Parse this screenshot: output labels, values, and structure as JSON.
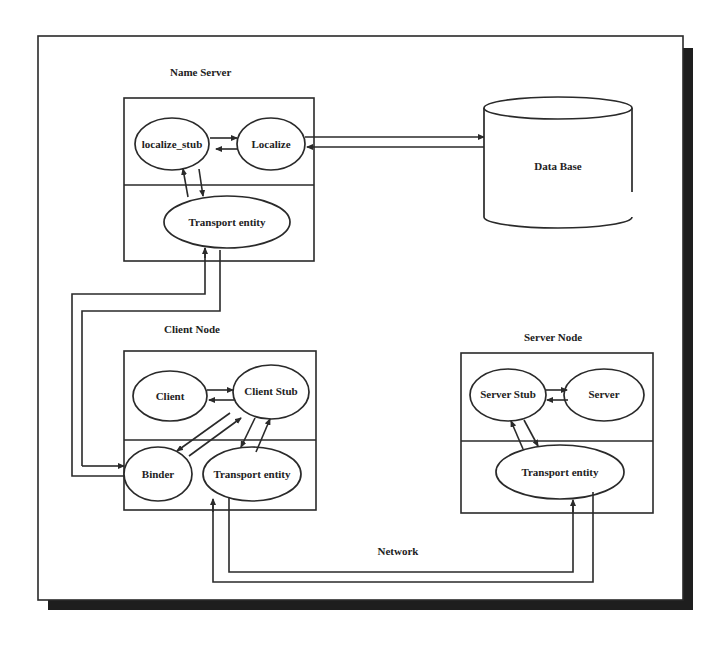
{
  "diagram": {
    "frame": {
      "shadow_color": "#1e1e1e",
      "line_color": "#2a2a2a"
    },
    "nodes": {
      "name_server": {
        "title": "Name Server",
        "localize_stub": "localize_stub",
        "localize": "Localize",
        "transport": "Transport entity"
      },
      "database": {
        "label": "Data Base"
      },
      "client_node": {
        "title": "Client Node",
        "client": "Client",
        "client_stub": "Client Stub",
        "binder": "Binder",
        "transport": "Transport entity"
      },
      "server_node": {
        "title": "Server Node",
        "server_stub": "Server Stub",
        "server": "Server",
        "transport": "Transport entity"
      }
    },
    "network_label": "Network",
    "connections": [
      {
        "from": "localize_stub",
        "to": "localize",
        "bidirectional": true
      },
      {
        "from": "localize",
        "to": "database",
        "bidirectional": true
      },
      {
        "from": "localize_stub",
        "to": "name_server.transport",
        "bidirectional": true
      },
      {
        "from": "name_server.transport",
        "to": "binder",
        "bidirectional": true
      },
      {
        "from": "client",
        "to": "client_stub",
        "bidirectional": true
      },
      {
        "from": "client_stub",
        "to": "binder",
        "bidirectional": true
      },
      {
        "from": "client_stub",
        "to": "client_node.transport",
        "bidirectional": true
      },
      {
        "from": "server_stub",
        "to": "server",
        "bidirectional": true
      },
      {
        "from": "server_stub",
        "to": "server_node.transport",
        "bidirectional": true
      },
      {
        "from": "client_node.transport",
        "to": "server_node.transport",
        "via": "Network",
        "bidirectional": true
      }
    ]
  }
}
